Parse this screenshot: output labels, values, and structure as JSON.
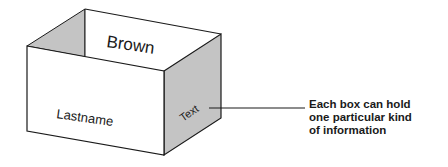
{
  "diagram": {
    "top_label": "Brown",
    "front_label": "Lastname",
    "side_label": "Text",
    "caption_lines": [
      "Each box can hold",
      "one particular kind",
      "of information"
    ]
  },
  "colors": {
    "stroke": "#1a1a1a",
    "shade": "#c4c4c4",
    "face": "#ffffff"
  }
}
